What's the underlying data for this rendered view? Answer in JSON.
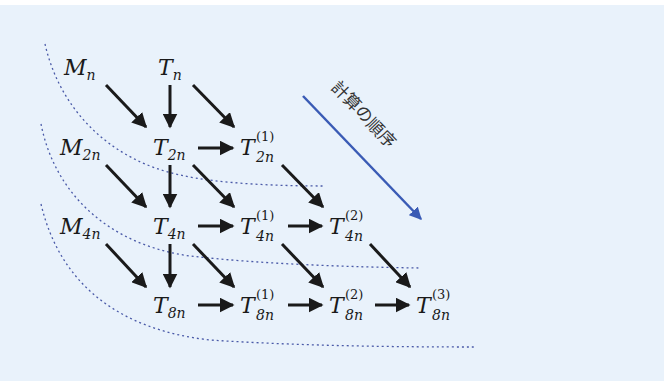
{
  "diagram": {
    "background_color": "#e9f2fb",
    "arrow_color": "#1a1a1a",
    "order_arrow_color": "#3a5bb5",
    "dotted_line_color": "#4a5aa8",
    "order_label": "計算の順序",
    "nodes": {
      "M_n": {
        "base": "M",
        "sub": "n",
        "sup": ""
      },
      "T_n": {
        "base": "T",
        "sub": "n",
        "sup": ""
      },
      "M_2n": {
        "base": "M",
        "sub": "2n",
        "sup": ""
      },
      "T_2n": {
        "base": "T",
        "sub": "2n",
        "sup": ""
      },
      "T1_2n": {
        "base": "T",
        "sub": "2n",
        "sup": "(1)"
      },
      "M_4n": {
        "base": "M",
        "sub": "4n",
        "sup": ""
      },
      "T_4n": {
        "base": "T",
        "sub": "4n",
        "sup": ""
      },
      "T1_4n": {
        "base": "T",
        "sub": "4n",
        "sup": "(1)"
      },
      "T2_4n": {
        "base": "T",
        "sub": "4n",
        "sup": "(2)"
      },
      "T_8n": {
        "base": "T",
        "sub": "8n",
        "sup": ""
      },
      "T1_8n": {
        "base": "T",
        "sub": "8n",
        "sup": "(1)"
      },
      "T2_8n": {
        "base": "T",
        "sub": "8n",
        "sup": "(2)"
      },
      "T3_8n": {
        "base": "T",
        "sub": "8n",
        "sup": "(3)"
      }
    },
    "edges": [
      [
        "M_n",
        "T_2n"
      ],
      [
        "T_n",
        "T_2n"
      ],
      [
        "T_n",
        "T1_2n"
      ],
      [
        "T_2n",
        "T1_2n"
      ],
      [
        "M_2n",
        "T_4n"
      ],
      [
        "T_2n",
        "T_4n"
      ],
      [
        "T_2n",
        "T1_4n"
      ],
      [
        "T1_2n",
        "T2_4n"
      ],
      [
        "T_4n",
        "T1_4n"
      ],
      [
        "T1_4n",
        "T2_4n"
      ],
      [
        "M_4n",
        "T_8n"
      ],
      [
        "T_4n",
        "T_8n"
      ],
      [
        "T_4n",
        "T1_8n"
      ],
      [
        "T1_4n",
        "T2_8n"
      ],
      [
        "T2_4n",
        "T3_8n"
      ],
      [
        "T_8n",
        "T1_8n"
      ],
      [
        "T1_8n",
        "T2_8n"
      ],
      [
        "T2_8n",
        "T3_8n"
      ]
    ]
  }
}
